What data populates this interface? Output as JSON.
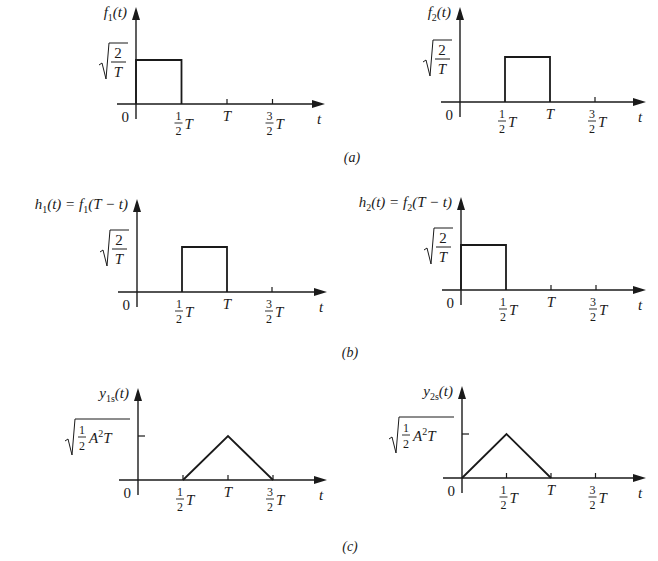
{
  "figure": {
    "captions": [
      {
        "label": "(a)",
        "x": 352,
        "y": 162
      },
      {
        "label": "(b)",
        "x": 350,
        "y": 357
      },
      {
        "label": "(c)",
        "x": 350,
        "y": 551
      }
    ]
  },
  "chart_data": [
    {
      "type": "line",
      "id": "f1",
      "row": "a",
      "title": "f1(t)",
      "ylabel_main": "f",
      "ylabel_sub": "1",
      "ylabel_rest": "(t)",
      "xlabel": "t",
      "y_level_label": "sqrt(2/T)",
      "y_level_kind": "sqrt2T",
      "x_ticks": [
        "0",
        "1/2 T",
        "T",
        "3/2 T"
      ],
      "x": [
        0,
        0,
        0.5,
        0.5
      ],
      "y": [
        0,
        1,
        1,
        0
      ],
      "layout": {
        "ox": 136,
        "oy": 104,
        "unit": 91,
        "amp": 44,
        "top": 7,
        "right": 325,
        "left": 117,
        "tick_marks": [
          1,
          1.5
        ]
      }
    },
    {
      "type": "line",
      "id": "f2",
      "row": "a",
      "title": "f2(t)",
      "ylabel_main": "f",
      "ylabel_sub": "2",
      "ylabel_rest": "(t)",
      "xlabel": "t",
      "y_level_label": "sqrt(2/T)",
      "y_level_kind": "sqrt2T",
      "x_ticks": [
        "0",
        "1/2 T",
        "T",
        "3/2 T"
      ],
      "x": [
        0.5,
        0.5,
        1,
        1
      ],
      "y": [
        0,
        1,
        1,
        0
      ],
      "layout": {
        "ox": 460,
        "oy": 102,
        "unit": 90,
        "amp": 45,
        "top": 7,
        "right": 646,
        "left": 441,
        "tick_marks": [
          1.5
        ]
      }
    },
    {
      "type": "line",
      "id": "h1",
      "row": "b",
      "title": "h1(t) = f1(T − t)",
      "ylabel_main": "h",
      "ylabel_sub": "1",
      "ylabel_rest": "(t) = f",
      "ylabel_sub2": "1",
      "ylabel_rest2": "(T − t)",
      "xlabel": "t",
      "y_level_label": "sqrt(2/T)",
      "y_level_kind": "sqrt2T",
      "x_ticks": [
        "0",
        "1/2 T",
        "T",
        "3/2 T"
      ],
      "x": [
        0.5,
        0.5,
        1,
        1
      ],
      "y": [
        0,
        1,
        1,
        0
      ],
      "layout": {
        "ox": 137,
        "oy": 292,
        "unit": 90,
        "amp": 45,
        "top": 199,
        "right": 327,
        "left": 118,
        "tick_marks": [
          1.5
        ]
      }
    },
    {
      "type": "line",
      "id": "h2",
      "row": "b",
      "title": "h2(t) = f2(T − t)",
      "ylabel_main": "h",
      "ylabel_sub": "2",
      "ylabel_rest": "(t) = f",
      "ylabel_sub2": "2",
      "ylabel_rest2": "(T − t)",
      "xlabel": "t",
      "y_level_label": "sqrt(2/T)",
      "y_level_kind": "sqrt2T",
      "x_ticks": [
        "0",
        "1/2 T",
        "T",
        "3/2 T"
      ],
      "x": [
        0,
        0,
        0.5,
        0.5
      ],
      "y": [
        0,
        1,
        1,
        0
      ],
      "layout": {
        "ox": 461,
        "oy": 290,
        "unit": 90,
        "amp": 45,
        "top": 197,
        "right": 646,
        "left": 442,
        "tick_marks": [
          1,
          1.5
        ]
      }
    },
    {
      "type": "line",
      "id": "y1s",
      "row": "c",
      "title": "y1s(t)",
      "ylabel_main": "y",
      "ylabel_sub": "1s",
      "ylabel_rest": "(t)",
      "xlabel": "t",
      "y_level_label": "sqrt((1/2) A^2 T)",
      "y_level_kind": "sqrtA2T",
      "x_ticks": [
        "0",
        "1/2 T",
        "T",
        "3/2 T"
      ],
      "x": [
        0.5,
        1,
        1.5
      ],
      "y": [
        0,
        1,
        0
      ],
      "layout": {
        "ox": 138,
        "oy": 480,
        "unit": 90,
        "amp": 44,
        "top": 388,
        "right": 327,
        "left": 119,
        "tick_marks": [
          0.5,
          1,
          1.5
        ],
        "ytick": true
      }
    },
    {
      "type": "line",
      "id": "y2s",
      "row": "c",
      "title": "y2s(t)",
      "ylabel_main": "y",
      "ylabel_sub": "2s",
      "ylabel_rest": "(t)",
      "xlabel": "t",
      "y_level_label": "sqrt((1/2) A^2 T)",
      "y_level_kind": "sqrtA2T",
      "x_ticks": [
        "0",
        "1/2 T",
        "T",
        "3/2 T"
      ],
      "x": [
        0,
        0.5,
        1
      ],
      "y": [
        0,
        1,
        0
      ],
      "layout": {
        "ox": 462,
        "oy": 478,
        "unit": 89,
        "amp": 44,
        "top": 386,
        "right": 646,
        "left": 443,
        "tick_marks": [
          0.5,
          1,
          1.5
        ],
        "ytick": true
      }
    }
  ]
}
